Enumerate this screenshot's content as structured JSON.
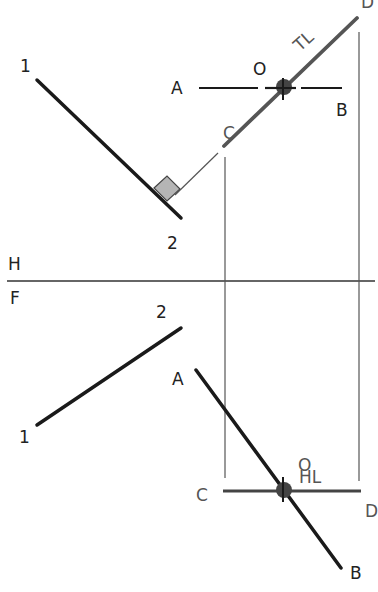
{
  "diagram": {
    "title": "",
    "views": {
      "top": {
        "name": "H",
        "line_12": {
          "start_label": "1",
          "end_label": "2"
        },
        "line_ab": {
          "start_label": "A",
          "end_label": "B"
        },
        "line_cd": {
          "start_label": "C",
          "end_label": "D",
          "annotation": "TL"
        },
        "point_o": {
          "label": "O"
        }
      },
      "front": {
        "name": "F",
        "line_12": {
          "start_label": "1",
          "end_label": "2"
        },
        "line_ab": {
          "start_label": "A",
          "end_label": "B"
        },
        "line_cd": {
          "start_label": "C",
          "end_label": "D",
          "annotation": "HL"
        },
        "point_o": {
          "label": "O"
        }
      }
    },
    "fold_line": {
      "upper_label": "H",
      "lower_label": "F"
    },
    "colors": {
      "line": "#1a1a1a",
      "gray_line": "#555555",
      "point": "#444444",
      "right_angle_fill": "#b5b5b5"
    }
  }
}
